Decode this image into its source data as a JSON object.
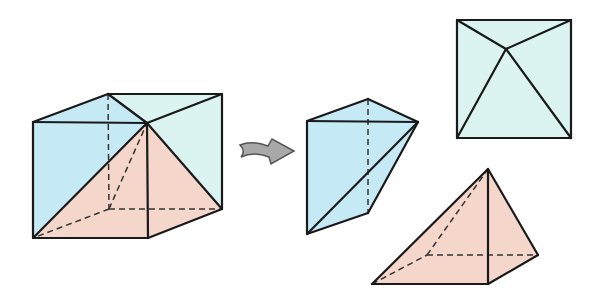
{
  "colors": {
    "blue": "#c6eaf5",
    "cyan": "#dbf4f1",
    "pink": "#f5d6cb",
    "edge": "#1a1a1a",
    "arrow": "#a8a8a8"
  },
  "figures": [
    {
      "name": "cube-with-pyramid",
      "faces": [
        {
          "name": "front-face",
          "fill": "blue",
          "points": "33,122 147,123 148,238 33,238"
        },
        {
          "name": "top-face",
          "fill": "cyan",
          "points": "33,122 108,94 222,94 147,123"
        },
        {
          "name": "top-left-triangle",
          "fill": "blue",
          "points": "33,122 108,94 147,123"
        },
        {
          "name": "right-face",
          "fill": "cyan",
          "points": "147,123 222,94 222,209 148,238"
        },
        {
          "name": "pyramid-front",
          "fill": "pink",
          "points": "33,238 147,123 148,238"
        },
        {
          "name": "pyramid-right",
          "fill": "pink",
          "points": "147,123 222,209 148,238"
        },
        {
          "name": "pyramid-base",
          "fill": "pink",
          "points": "33,238 109,209 222,209 148,238"
        }
      ],
      "edges": [
        "33,122 147,123",
        "33,122 108,94",
        "108,94 222,94",
        "222,94 147,123",
        "108,94 147,123",
        "33,122 33,238",
        "33,238 148,238",
        "147,123 148,238",
        "222,94 222,209",
        "222,209 148,238",
        "33,238 147,123",
        "147,123 222,209"
      ],
      "hidden_edges": [
        "108,94 109,209",
        "109,209 222,209",
        "109,209 33,238",
        "109,209 147,123"
      ]
    },
    {
      "name": "prism-piece",
      "faces": [
        {
          "name": "prism-body",
          "fill": "blue",
          "points": "307,121 368,99 418,122 368,213 307,234"
        }
      ],
      "edges": [
        "307,121 368,99",
        "368,99 418,122",
        "307,121 418,122",
        "307,121 307,234",
        "307,234 368,213",
        "368,213 418,122",
        "307,234 418,122"
      ],
      "hidden_edges": [
        "368,99 368,213"
      ]
    },
    {
      "name": "top-view-square",
      "faces": [
        {
          "name": "square-face",
          "fill": "cyan",
          "points": "457,20 571,20 571,138 457,138"
        }
      ],
      "edges": [
        "457,20 571,20",
        "571,20 571,138",
        "571,138 457,138",
        "457,138 457,20",
        "457,20 506,49",
        "571,20 506,49",
        "506,49 457,138",
        "506,49 571,138"
      ],
      "hidden_edges": []
    },
    {
      "name": "pyramid-piece",
      "faces": [
        {
          "name": "pyramid-body",
          "fill": "pink",
          "points": "372,284 488,169 538,255 488,284"
        }
      ],
      "edges": [
        "372,284 488,169",
        "488,169 538,255",
        "488,169 488,284",
        "372,284 488,284",
        "488,284 538,255"
      ],
      "hidden_edges": [
        "372,284 427,255",
        "427,255 538,255",
        "427,255 488,169"
      ]
    }
  ],
  "arrow": {
    "name": "transform-arrow",
    "path": "M240,145 Q252,140 268,146 L272,139 L294,151 L271,164 L269,157 Q254,151 241,157 Q246,151 240,145 Z"
  }
}
